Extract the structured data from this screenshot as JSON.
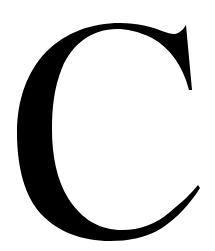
{
  "image": {
    "glyph": "C",
    "description": "Large black serif capital letter C on white background",
    "colors": {
      "foreground": "#000000",
      "background": "#ffffff"
    }
  }
}
